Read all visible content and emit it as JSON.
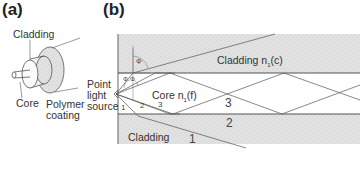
{
  "panel_a": {
    "label": "(a)",
    "labels": {
      "cladding": "Cladding",
      "core": "Core",
      "polymer_coating_line1": "Polymer",
      "polymer_coating_line2": "coating"
    }
  },
  "panel_b": {
    "label": "(b)",
    "labels": {
      "source_line1": "Point",
      "source_line2": "light",
      "source_line3": "source",
      "cladding_top": "Cladding n",
      "cladding_top_sub": "1",
      "cladding_top_suffix": "(c)",
      "core": "Core n",
      "core_sub": "1",
      "core_suffix": "(f)",
      "cladding_bottom": "Cladding",
      "angle_phi": "Φ",
      "angle_theta_1": "Φ",
      "angle_theta_2": "Φ"
    },
    "ray_numbers": {
      "r1_small": "1",
      "r2_small": "2",
      "r3_small": "3",
      "r3_large": "3",
      "r2_large": "2",
      "r1_large": "1"
    }
  },
  "colors": {
    "line": "#555555",
    "cladding_fill": "#e4e4e4",
    "core_fill": "#ffffff",
    "polymer_fill": "#d6d6d6"
  }
}
